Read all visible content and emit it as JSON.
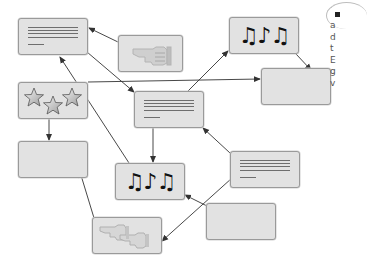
{
  "diagram": {
    "type": "flow-diagram",
    "colors": {
      "node_fill": "#e2e2e2",
      "node_border": "#9a9a9a",
      "arrow": "#333333",
      "text_lines": "#6e6e6e"
    },
    "nodes": [
      {
        "id": "A",
        "kind": "text-document",
        "icon": "text-lines-icon"
      },
      {
        "id": "B",
        "kind": "pointing-hand",
        "icon": "pointing-hand-icon"
      },
      {
        "id": "C",
        "kind": "music",
        "icon": "music-notes-icon",
        "glyphs": "♫♪♫"
      },
      {
        "id": "D",
        "kind": "empty"
      },
      {
        "id": "E",
        "kind": "stars",
        "icon": "stars-icon",
        "glyphs": "☆☆☆"
      },
      {
        "id": "F",
        "kind": "text-document",
        "icon": "text-lines-icon"
      },
      {
        "id": "G",
        "kind": "empty"
      },
      {
        "id": "H",
        "kind": "music",
        "icon": "music-notes-icon",
        "glyphs": "♫♪♫"
      },
      {
        "id": "I",
        "kind": "text-document",
        "icon": "text-lines-icon"
      },
      {
        "id": "J",
        "kind": "empty"
      },
      {
        "id": "K",
        "kind": "pointing-hands",
        "icon": "pointing-hands-icon"
      }
    ],
    "edges": [
      {
        "from": "B",
        "to": "A"
      },
      {
        "from": "A",
        "to": "F"
      },
      {
        "from": "E",
        "to": "D"
      },
      {
        "from": "F",
        "to": "C"
      },
      {
        "from": "C",
        "to": "D"
      },
      {
        "from": "E",
        "to": "G"
      },
      {
        "from": "H",
        "to": "A"
      },
      {
        "from": "F",
        "to": "H"
      },
      {
        "from": "I",
        "to": "F"
      },
      {
        "from": "J",
        "to": "H"
      },
      {
        "from": "I",
        "to": "K"
      },
      {
        "from": "K",
        "to": "G"
      }
    ]
  },
  "side_text": {
    "lines": [
      "a",
      "d",
      "t",
      "E",
      "g",
      "v"
    ]
  }
}
